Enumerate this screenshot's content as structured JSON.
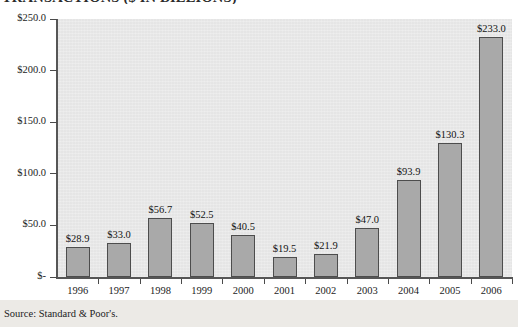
{
  "chart_data": {
    "type": "bar",
    "title": "TRANSACTIONS ($ IN BILLIONS)",
    "xlabel": "",
    "ylabel": "",
    "ylim": [
      0,
      250
    ],
    "ytick_values": [
      250,
      200,
      150,
      100,
      50,
      0
    ],
    "ytick_labels": [
      "$250.0",
      "$200.0",
      "$150.0",
      "$100.0",
      "$50.0",
      "$-"
    ],
    "grid": false,
    "legend": "none",
    "categories": [
      "1996",
      "1997",
      "1998",
      "1999",
      "2000",
      "2001",
      "2002",
      "2003",
      "2004",
      "2005",
      "2006"
    ],
    "values": [
      28.9,
      33.0,
      56.7,
      52.5,
      40.5,
      19.5,
      21.9,
      47.0,
      93.9,
      130.3,
      233.0
    ],
    "data_labels": [
      "$28.9",
      "$33.0",
      "$56.7",
      "$52.5",
      "$40.5",
      "$19.5",
      "$21.9",
      "$47.0",
      "$93.9",
      "$130.3",
      "$233.0"
    ],
    "bar_color": "#a9a9a9",
    "bar_border_color": "#4d4d4d",
    "plot_background": "#e8e8e8",
    "axis_color": "#565656",
    "source": "Source: Standard & Poor's."
  },
  "footer": {
    "source": "Source: Standard & Poor's."
  }
}
